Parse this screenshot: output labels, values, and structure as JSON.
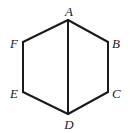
{
  "diagram": {
    "type": "geometry",
    "shape": "hexagon",
    "vertices": [
      {
        "id": "A",
        "label": "A",
        "x": 68,
        "y": 20,
        "lx": 69,
        "ly": 16,
        "anchor": "middle"
      },
      {
        "id": "B",
        "label": "B",
        "x": 108,
        "y": 42,
        "lx": 112,
        "ly": 48,
        "anchor": "start"
      },
      {
        "id": "C",
        "label": "C",
        "x": 108,
        "y": 92,
        "lx": 112,
        "ly": 98,
        "anchor": "start"
      },
      {
        "id": "D",
        "label": "D",
        "x": 68,
        "y": 114,
        "lx": 69,
        "ly": 129,
        "anchor": "middle"
      },
      {
        "id": "E",
        "label": "E",
        "x": 23,
        "y": 92,
        "lx": 18,
        "ly": 98,
        "anchor": "end"
      },
      {
        "id": "F",
        "label": "F",
        "x": 23,
        "y": 42,
        "lx": 18,
        "ly": 48,
        "anchor": "end"
      }
    ],
    "edges": [
      [
        "A",
        "B"
      ],
      [
        "B",
        "C"
      ],
      [
        "C",
        "D"
      ],
      [
        "D",
        "E"
      ],
      [
        "E",
        "F"
      ],
      [
        "F",
        "A"
      ],
      [
        "A",
        "D"
      ]
    ],
    "colors": {
      "stroke": "#1a1a1a",
      "background": "#ffffff"
    }
  }
}
